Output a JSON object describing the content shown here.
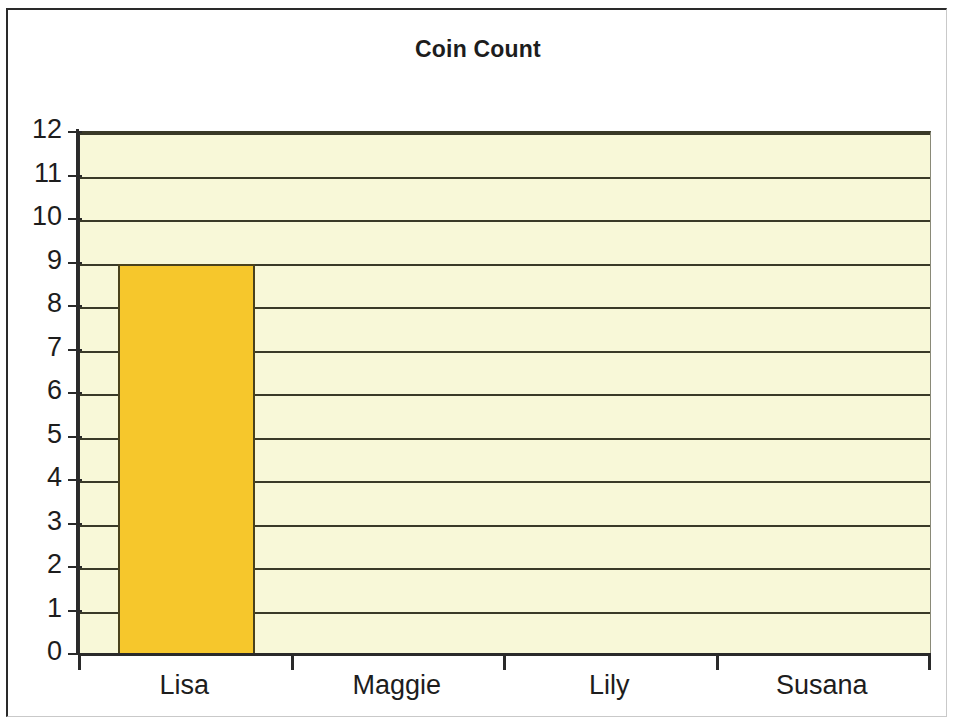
{
  "chart_data": {
    "type": "bar",
    "title": "Coin Count",
    "xlabel": "",
    "ylabel": "",
    "categories": [
      "Lisa",
      "Maggie",
      "Lily",
      "Susana"
    ],
    "values": [
      9,
      0,
      0,
      0
    ],
    "ylim": [
      0,
      12
    ],
    "y_ticks": [
      12,
      11,
      10,
      9,
      8,
      7,
      6,
      5,
      4,
      3,
      2,
      1,
      0
    ],
    "grid": true,
    "legend": "none",
    "series": [
      {
        "name": "Coin Count",
        "values": [
          9,
          0,
          0,
          0
        ]
      }
    ],
    "colors": {
      "bar_fill": "#f6c72c",
      "bar_border": "#4a421c",
      "plot_background": "#f8f8d8",
      "gridline": "#3a3a28",
      "axis": "#2a2a2a",
      "text": "#1d1d1d",
      "page_background": "#ffffff",
      "frame_border": "#2a2a2a"
    }
  }
}
